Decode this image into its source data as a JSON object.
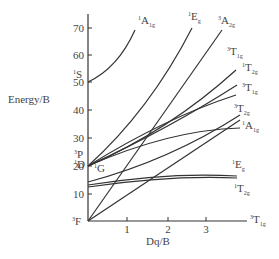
{
  "diagram": {
    "type": "Tanabe-Sugano diagram",
    "xlabel": "Dq/B",
    "ylabel": "Energy/B",
    "x_ticks": [
      "1",
      "2",
      "3"
    ],
    "y_ticks": [
      "10",
      "20",
      "30",
      "40",
      "50",
      "60",
      "70"
    ],
    "left_terms": [
      {
        "mult": "3",
        "name": "F",
        "energy": 0
      },
      {
        "mult": "1",
        "name": "D",
        "energy": 20
      },
      {
        "mult": "3",
        "name": "P",
        "energy": 22
      },
      {
        "mult": "1",
        "name": "G",
        "energy": 20
      },
      {
        "mult": "1",
        "name": "S",
        "energy": 51
      }
    ],
    "right_states": [
      {
        "mult": "1",
        "name": "A",
        "sub": "1g"
      },
      {
        "mult": "1",
        "name": "E",
        "sub": "g"
      },
      {
        "mult": "3",
        "name": "A",
        "sub": "2g"
      },
      {
        "mult": "3",
        "name": "T",
        "sub": "1g"
      },
      {
        "mult": "1",
        "name": "T",
        "sub": "2g"
      },
      {
        "mult": "3",
        "name": "T",
        "sub": "1g"
      },
      {
        "mult": "3",
        "name": "T",
        "sub": "2g"
      },
      {
        "mult": "1",
        "name": "A",
        "sub": "1g"
      },
      {
        "mult": "1",
        "name": "E",
        "sub": "g"
      },
      {
        "mult": "1",
        "name": "T",
        "sub": "2g"
      },
      {
        "mult": "3",
        "name": "T",
        "sub": "1g"
      }
    ]
  }
}
